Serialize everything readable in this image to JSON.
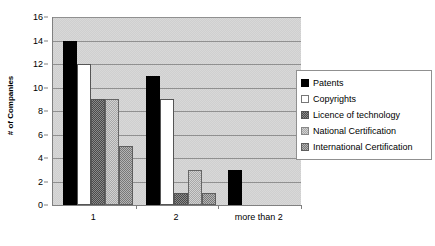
{
  "chart_data": {
    "type": "bar",
    "title": "",
    "xlabel": "",
    "ylabel": "# of Companies",
    "categories": [
      "1",
      "2",
      "more than 2"
    ],
    "series": [
      {
        "name": "Patents",
        "values": [
          14,
          11,
          3
        ],
        "swatch": "solid-black"
      },
      {
        "name": "Copyrights",
        "values": [
          12,
          9,
          0
        ],
        "swatch": "white-empty"
      },
      {
        "name": "Licence of technology",
        "values": [
          9,
          1,
          0
        ],
        "swatch": "dark-checker"
      },
      {
        "name": "National Certification",
        "values": [
          9,
          3,
          0
        ],
        "swatch": "light-checker"
      },
      {
        "name": "International Certification",
        "values": [
          5,
          1,
          0
        ],
        "swatch": "medium-checker"
      }
    ],
    "ylim": [
      0,
      16
    ],
    "yticks": [
      0,
      2,
      4,
      6,
      8,
      10,
      12,
      14,
      16
    ],
    "ytick_labels": [
      "0",
      "2",
      "4",
      "6",
      "8",
      "10",
      "12",
      "14",
      "16"
    ],
    "grid": true,
    "legend_position": "right",
    "plot_background": "#d8d8d8",
    "gridline_color": "#909090",
    "axis_color": "#808080"
  },
  "legend": {
    "items": [
      {
        "label": "Patents"
      },
      {
        "label": "Copyrights"
      },
      {
        "label": "Licence of technology"
      },
      {
        "label": "National Certification"
      },
      {
        "label": "International Certification"
      }
    ]
  }
}
